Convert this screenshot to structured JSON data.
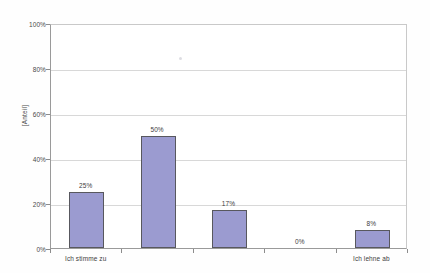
{
  "chart_data": {
    "type": "bar",
    "title": "Ich halte die Maßnahme für sinnvoll",
    "categories": [
      "Ich stimme zu",
      "",
      "",
      "",
      "Ich lehne ab"
    ],
    "values": [
      25,
      50,
      17,
      0,
      8
    ],
    "data_labels": [
      "25%",
      "50%",
      "17%",
      "0%",
      "8%"
    ],
    "xlabel": "",
    "ylabel": "[Anteil]",
    "ylim": [
      0,
      100
    ],
    "ytick_labels": [
      "100%",
      "80%",
      "60%",
      "40%",
      "20%",
      "0%"
    ],
    "ytick_values": [
      100,
      80,
      60,
      40,
      20,
      0
    ],
    "grid": true,
    "legend": false,
    "bar_color": "#9b9bd0",
    "bar_border_color": "#58585e",
    "gridline_color": "#d8d8d8",
    "axis_color": "#8c8c8c",
    "visible_category_labels": [
      {
        "index": 0,
        "label": "Ich stimme zu"
      },
      {
        "index": 4,
        "label": "Ich lehne ab"
      }
    ]
  }
}
